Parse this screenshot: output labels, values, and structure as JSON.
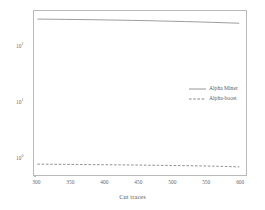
{
  "chart_data": {
    "type": "line",
    "title": "",
    "xlabel": "Cut traces",
    "ylabel": "",
    "yscale": "log",
    "xscale": "linear",
    "xlim": [
      295,
      610
    ],
    "ylim": [
      0.5,
      450
    ],
    "grid": false,
    "legend_position": "center right",
    "xticks": [
      300,
      350,
      400,
      450,
      500,
      550,
      600
    ],
    "xtick_labels": [
      "300",
      "350",
      "400",
      "450",
      "500",
      "550",
      "600"
    ],
    "yticks": [
      1,
      10,
      100
    ],
    "ytick_labels": [
      "10⁰",
      "10¹",
      "10²"
    ],
    "x": [
      300,
      320,
      340,
      360,
      380,
      400,
      420,
      440,
      460,
      480,
      500,
      520,
      540,
      560,
      580,
      600
    ],
    "series": [
      {
        "name": "Alpha Miner",
        "style": "solid",
        "color": "#8a8a8a",
        "values": [
          322,
          320,
          318,
          316,
          314,
          311,
          308,
          305,
          302,
          298,
          294,
          290,
          286,
          281,
          276,
          271
        ]
      },
      {
        "name": "Alpha-boost",
        "style": "dashed",
        "color": "#7c7c7c",
        "values": [
          0.785,
          0.781,
          0.777,
          0.773,
          0.769,
          0.765,
          0.761,
          0.757,
          0.752,
          0.747,
          0.742,
          0.736,
          0.73,
          0.722,
          0.712,
          0.7
        ]
      }
    ]
  },
  "axes": {
    "frame_color": "#b9b9b9",
    "tick_color": "#9b9b9b",
    "label_color": "#6a6a6a"
  },
  "legend": {
    "entries": [
      {
        "label": "Alpha Miner",
        "style": "solid"
      },
      {
        "label": "Alpha-boost",
        "style": "dashed"
      }
    ]
  }
}
